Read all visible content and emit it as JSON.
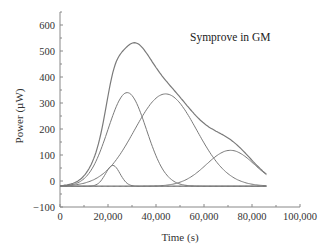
{
  "chart_data": {
    "type": "line",
    "title": "",
    "annotation": "Symprove in GM",
    "xlabel": "Time (s)",
    "ylabel": "Power (µW)",
    "xlim": [
      0,
      100000
    ],
    "ylim": [
      -100,
      650
    ],
    "x_ticks": [
      0,
      20000,
      40000,
      60000,
      80000,
      100000
    ],
    "x_tick_labels": [
      "0",
      "20,000",
      "40,000",
      "60,000",
      "80,000",
      "100,000"
    ],
    "y_ticks": [
      -100,
      0,
      100,
      200,
      300,
      400,
      500,
      600
    ],
    "y_tick_labels": [
      "−100",
      "0",
      "100",
      "200",
      "300",
      "400",
      "500",
      "600"
    ],
    "grid": false,
    "legend": null,
    "baseline": -20,
    "x_end": 86000,
    "series": [
      {
        "name": "Total (measured)",
        "peak_x": 30500,
        "peak_y": 560
      },
      {
        "name": "Component 1",
        "peak_x": 22000,
        "peak_y": 60,
        "sigma": 3000
      },
      {
        "name": "Component 2",
        "peak_x": 28000,
        "peak_y": 340,
        "sigma": 8000
      },
      {
        "name": "Component 3",
        "peak_x": 44000,
        "peak_y": 335,
        "sigma": 13000
      },
      {
        "name": "Component 4",
        "peak_x": 71000,
        "peak_y": 118,
        "sigma": 10000
      }
    ],
    "line_color": "#7a7a7a"
  }
}
